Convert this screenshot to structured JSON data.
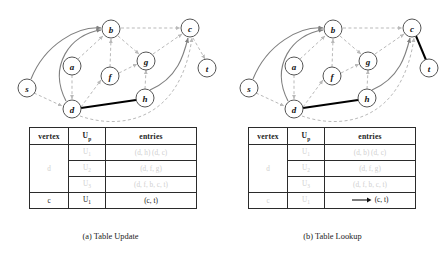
{
  "figure": {
    "panels": [
      {
        "id": "panel-a",
        "caption": "(a) Table Update",
        "graph": {
          "nodes": [
            {
              "id": "s",
              "label": "s",
              "x": 27,
              "y": 84
            },
            {
              "id": "a",
              "label": "a",
              "x": 72,
              "y": 62
            },
            {
              "id": "b",
              "label": "b",
              "x": 111,
              "y": 25
            },
            {
              "id": "c",
              "label": "c",
              "x": 190,
              "y": 24
            },
            {
              "id": "d",
              "label": "d",
              "x": 72,
              "y": 105
            },
            {
              "id": "f",
              "label": "f",
              "x": 110,
              "y": 72
            },
            {
              "id": "g",
              "label": "g",
              "x": 146,
              "y": 57
            },
            {
              "id": "h",
              "label": "h",
              "x": 145,
              "y": 94
            },
            {
              "id": "t",
              "label": "t",
              "x": 207,
              "y": 64
            }
          ],
          "bold_edges": [
            [
              "d",
              "h"
            ]
          ],
          "solid_curved_edges": [
            [
              "s",
              "b"
            ],
            [
              "d",
              "b"
            ],
            [
              "h",
              "c"
            ]
          ],
          "dashed_edges": [
            [
              "s",
              "d"
            ],
            [
              "a",
              "d"
            ],
            [
              "a",
              "b"
            ],
            [
              "d",
              "f"
            ],
            [
              "f",
              "b"
            ],
            [
              "f",
              "g"
            ],
            [
              "b",
              "g"
            ],
            [
              "b",
              "c"
            ],
            [
              "g",
              "c"
            ],
            [
              "h",
              "g"
            ],
            [
              "c",
              "t"
            ],
            [
              "d",
              "c"
            ]
          ]
        },
        "table": {
          "headers": [
            "vertex",
            "U",
            "entries"
          ],
          "header_sub": "p",
          "rows": [
            {
              "vertex": "d",
              "vertex_span": 3,
              "vertex_style": "faint",
              "u": "U",
              "u_sub": "1",
              "u_style": "faint",
              "entries": "(d, h) (d, c)",
              "entries_style": "faint",
              "arrow": false
            },
            {
              "vertex": null,
              "u": "U",
              "u_sub": "2",
              "u_style": "faint",
              "entries": "(d, f, g)",
              "entries_style": "faint",
              "arrow": false
            },
            {
              "vertex": null,
              "u": "U",
              "u_sub": "3",
              "u_style": "faint",
              "entries": "(d, f, b, c, t)",
              "entries_style": "faint",
              "arrow": false
            },
            {
              "vertex": "c",
              "vertex_span": 1,
              "vertex_style": "dark",
              "u": "U",
              "u_sub": "1",
              "u_style": "dark",
              "entries": "(c, t)",
              "entries_style": "dark",
              "arrow": false
            }
          ]
        }
      },
      {
        "id": "panel-b",
        "caption": "(b) Table Lookup",
        "graph": {
          "nodes": [
            {
              "id": "s",
              "label": "s",
              "x": 27,
              "y": 84
            },
            {
              "id": "a",
              "label": "a",
              "x": 72,
              "y": 62
            },
            {
              "id": "b",
              "label": "b",
              "x": 111,
              "y": 25
            },
            {
              "id": "c",
              "label": "c",
              "x": 190,
              "y": 24
            },
            {
              "id": "d",
              "label": "d",
              "x": 72,
              "y": 105
            },
            {
              "id": "f",
              "label": "f",
              "x": 110,
              "y": 72
            },
            {
              "id": "g",
              "label": "g",
              "x": 146,
              "y": 57
            },
            {
              "id": "h",
              "label": "h",
              "x": 145,
              "y": 94
            },
            {
              "id": "t",
              "label": "t",
              "x": 207,
              "y": 64
            }
          ],
          "bold_edges": [
            [
              "d",
              "h"
            ],
            [
              "c",
              "t"
            ]
          ],
          "solid_curved_edges": [
            [
              "s",
              "b"
            ],
            [
              "d",
              "b"
            ],
            [
              "h",
              "c"
            ]
          ],
          "dashed_edges": [
            [
              "s",
              "d"
            ],
            [
              "a",
              "d"
            ],
            [
              "a",
              "b"
            ],
            [
              "d",
              "f"
            ],
            [
              "f",
              "b"
            ],
            [
              "f",
              "g"
            ],
            [
              "b",
              "g"
            ],
            [
              "b",
              "c"
            ],
            [
              "g",
              "c"
            ],
            [
              "h",
              "g"
            ],
            [
              "d",
              "c"
            ]
          ]
        },
        "table": {
          "headers": [
            "vertex",
            "U",
            "entries"
          ],
          "header_sub": "p",
          "rows": [
            {
              "vertex": "d",
              "vertex_span": 3,
              "vertex_style": "faint",
              "u": "U",
              "u_sub": "1",
              "u_style": "faint",
              "entries": "(d, b) (d, c)",
              "entries_style": "faint",
              "arrow": false
            },
            {
              "vertex": null,
              "u": "U",
              "u_sub": "2",
              "u_style": "faint",
              "entries": "(d, f, g)",
              "entries_style": "faint",
              "arrow": false
            },
            {
              "vertex": null,
              "u": "U",
              "u_sub": "3",
              "u_style": "faint",
              "entries": "(d, f, b, c, t)",
              "entries_style": "faint",
              "arrow": false
            },
            {
              "vertex": "c",
              "vertex_span": 1,
              "vertex_style": "faint",
              "u": "U",
              "u_sub": "1",
              "u_style": "faint",
              "entries": "(c, t)",
              "entries_style": "dark",
              "arrow": true
            }
          ]
        }
      }
    ],
    "colors": {
      "bold_edge": "#000000",
      "solid_edge": "#808080",
      "dashed_edge": "#b9b9b9",
      "node_stroke": "#555555",
      "faint_text": "#cfcfcf",
      "dark_text": "#111111"
    }
  }
}
